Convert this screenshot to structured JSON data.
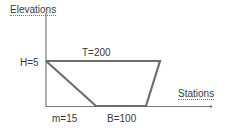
{
  "diagram": {
    "type": "trapezoidal-channel-cross-section",
    "y_axis_label": "Elevations",
    "x_axis_label": "Stations",
    "labels": {
      "height": "H=5",
      "top_width": "T=200",
      "side_slope": "m=15",
      "bottom_width": "B=100"
    },
    "colors": {
      "axis": "#7a7a7a",
      "channel": "#6e6e6e",
      "text": "#3a3a3a"
    }
  }
}
